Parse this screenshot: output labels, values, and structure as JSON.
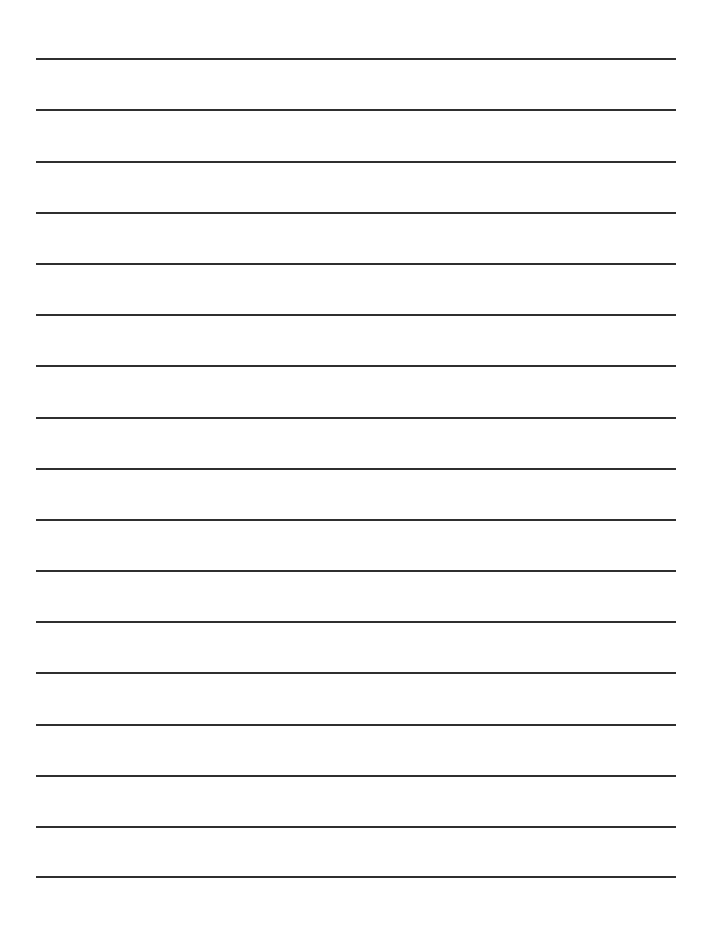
{
  "page": {
    "type": "lined-writing-paper",
    "background_color": "#ffffff",
    "line_color": "#2f2f2f",
    "line_count": 17,
    "line_left": 36,
    "line_width": 640,
    "line_thickness": 2,
    "line_positions_y": [
      58,
      109,
      161,
      212,
      263,
      314,
      365,
      417,
      468,
      519,
      570,
      621,
      672,
      724,
      775,
      826,
      876
    ]
  }
}
